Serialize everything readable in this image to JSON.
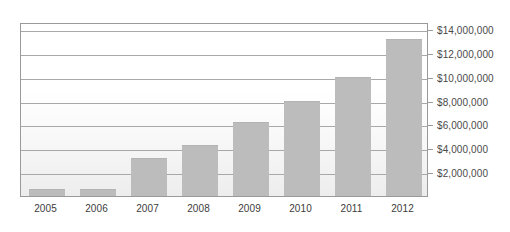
{
  "chart_data": {
    "type": "bar",
    "title": "",
    "subtitle": "",
    "xlabel": "",
    "ylabel": "",
    "categories": [
      "2005",
      "2006",
      "2007",
      "2008",
      "2009",
      "2010",
      "2011",
      "2012"
    ],
    "values": [
      550000,
      600000,
      3200000,
      4300000,
      6200000,
      8000000,
      10000000,
      13200000
    ],
    "series": [
      {
        "name": "",
        "values": [
          550000,
          600000,
          3200000,
          4300000,
          6200000,
          8000000,
          10000000,
          13200000
        ]
      }
    ],
    "ylim": [
      0,
      14600000
    ],
    "ytick_values": [
      2000000,
      4000000,
      6000000,
      8000000,
      10000000,
      12000000,
      14000000
    ],
    "ytick_labels": [
      "$2,000,000",
      "$4,000,000",
      "$6,000,000",
      "$8,000,000",
      "$10,000,000",
      "$12,000,000",
      "$14,000,000"
    ],
    "grid": true,
    "legend": "none",
    "bar_color": "#bcbcbc",
    "grid_color": "#a8a8a8",
    "frame_color": "#9a9a9a",
    "text_color": "#3c3c3c"
  }
}
